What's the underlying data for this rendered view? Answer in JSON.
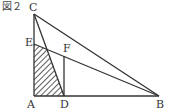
{
  "figure": {
    "title": "図２",
    "line_color": "#333333",
    "points": {
      "A": {
        "label": "A",
        "x": 34,
        "y": 96
      },
      "B": {
        "label": "B",
        "x": 159,
        "y": 96
      },
      "C": {
        "label": "C",
        "x": 34,
        "y": 14
      },
      "D": {
        "label": "D",
        "x": 64,
        "y": 96
      },
      "E": {
        "label": "E",
        "x": 34,
        "y": 44
      },
      "F": {
        "label": "F",
        "x": 64,
        "y": 56
      }
    },
    "segments": [
      "AB",
      "AC",
      "CB",
      "CD",
      "EB",
      "FD"
    ],
    "shaded_region": "A-E-G-D (hatched quadrilateral)"
  }
}
